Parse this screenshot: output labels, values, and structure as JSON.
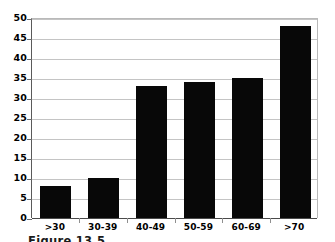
{
  "chart_data": {
    "type": "bar",
    "title": "",
    "subtitle": "",
    "xlabel": "",
    "ylabel": "",
    "categories": [
      ">30",
      "30-39",
      "40-49",
      "50-59",
      "60-69",
      ">70"
    ],
    "values": [
      8,
      10,
      33,
      34,
      35,
      48
    ],
    "series": [
      {
        "name": "count",
        "values": [
          8,
          10,
          33,
          34,
          35,
          48
        ]
      }
    ],
    "ylim": [
      0,
      50
    ],
    "ytick_step": 5,
    "ytick_labels": [
      "0",
      "5",
      "10",
      "15",
      "20",
      "25",
      "30",
      "35",
      "40",
      "45",
      "50"
    ],
    "ytick_values": [
      0,
      5,
      10,
      15,
      20,
      25,
      30,
      35,
      40,
      45,
      50
    ],
    "grid": true,
    "grid_axis": "y",
    "legend": false,
    "legend_position": "none",
    "bar_color": "#080808",
    "grid_color": "#c4c4c4",
    "axis_color": "#4a4a4a",
    "background_color": "#ffffff"
  },
  "caption": {
    "text": "Figure 13.5"
  }
}
